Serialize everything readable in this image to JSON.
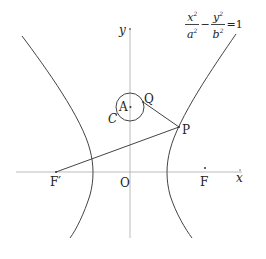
{
  "diagram": {
    "type": "hyperbola-geometry",
    "equation": {
      "x_num": "x",
      "x_den": "a",
      "y_num": "y",
      "y_den": "b",
      "exp": "2",
      "minus": "−",
      "equals": "=1"
    },
    "axes": {
      "x_label": "x",
      "y_label": "y",
      "origin_label": "O"
    },
    "points": {
      "F": "F",
      "F_prime": "F′",
      "A": "A",
      "P": "P",
      "Q": "Q",
      "C": "C"
    },
    "colors": {
      "stroke": "#444444",
      "axis": "#999999",
      "text": "#222222"
    }
  }
}
